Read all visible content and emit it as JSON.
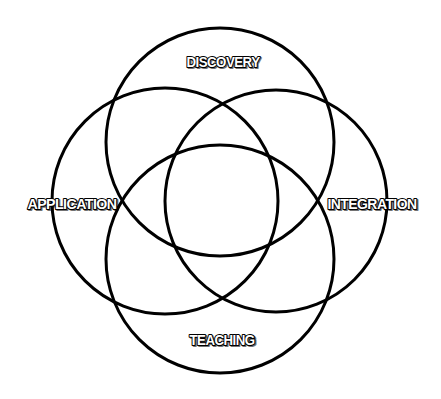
{
  "diagram": {
    "type": "four-circle venn",
    "stroke_color": "#000000",
    "background_color": "#ffffff",
    "label_fill_color": "#ffffff",
    "label_outline_color": "#000000",
    "circles": [
      {
        "id": "discovery",
        "label": "DISCOVERY",
        "cx": 220,
        "cy": 142,
        "r": 114,
        "label_x": 223,
        "label_y": 67
      },
      {
        "id": "application",
        "label": "APPLICATION",
        "cx": 165,
        "cy": 201,
        "r": 113,
        "label_x": 72,
        "label_y": 209
      },
      {
        "id": "integration",
        "label": "INTEGRATION",
        "cx": 276,
        "cy": 201,
        "r": 111,
        "label_x": 372,
        "label_y": 209
      },
      {
        "id": "teaching",
        "label": "TEACHING",
        "cx": 220,
        "cy": 259,
        "r": 114,
        "label_x": 222,
        "label_y": 345
      }
    ]
  }
}
